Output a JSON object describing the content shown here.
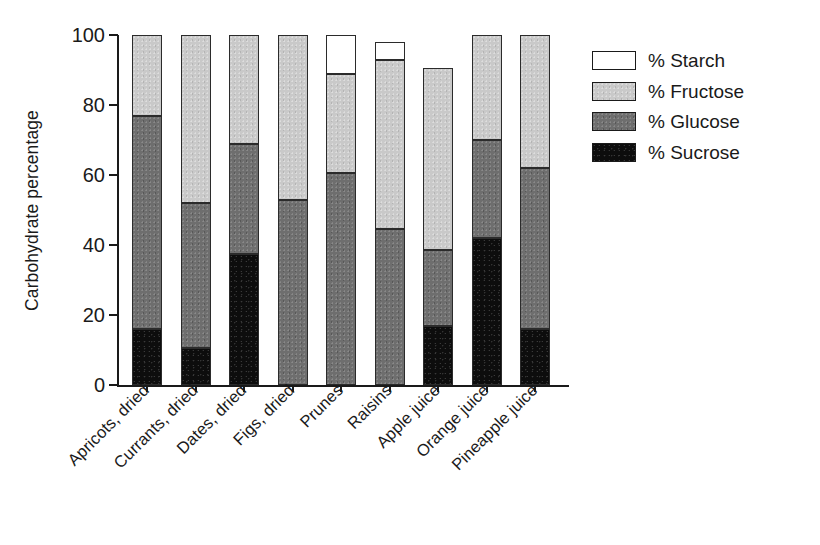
{
  "chart_data": {
    "type": "bar",
    "subtype": "stacked-vertical",
    "title": "",
    "xlabel": "",
    "ylabel": "Carbohydrate percentage",
    "ylim": [
      0,
      100
    ],
    "yticks": [
      0,
      20,
      40,
      60,
      80,
      100
    ],
    "ytick_labels": [
      "0",
      "20",
      "40",
      "60",
      "80",
      "100"
    ],
    "grid": false,
    "legend_position": "right",
    "categories": [
      "Apricots, dried",
      "Currants, dried",
      "Dates, dried",
      "Figs, dried",
      "Prunes",
      "Raisins",
      "Apple juice",
      "Orange juice",
      "Pineapple juice"
    ],
    "series": [
      {
        "name": "% Sucrose",
        "color": "#0d0d0d",
        "values": [
          16,
          10.5,
          37.5,
          0,
          0,
          0,
          17,
          42,
          16
        ]
      },
      {
        "name": "% Glucose",
        "color": "#6e6e6e",
        "values": [
          61,
          41.5,
          31.5,
          53,
          60.5,
          44.5,
          21.5,
          28,
          46
        ]
      },
      {
        "name": "% Fructose",
        "color": "#c9c9c9",
        "values": [
          23,
          48,
          31,
          47,
          28.5,
          48.5,
          52,
          30,
          38
        ]
      },
      {
        "name": "% Starch",
        "color": "#ffffff",
        "values": [
          0,
          0,
          0,
          0,
          11,
          5,
          0,
          0,
          0
        ]
      }
    ],
    "bar_totals": [
      100,
      100,
      100,
      100,
      100,
      98,
      90.5,
      100,
      100
    ]
  },
  "legend": {
    "items": [
      {
        "label": "% Starch",
        "swatch": "starch"
      },
      {
        "label": "% Fructose",
        "swatch": "fructose"
      },
      {
        "label": "% Glucose",
        "swatch": "glucose"
      },
      {
        "label": "% Sucrose",
        "swatch": "sucrose"
      }
    ]
  },
  "colors": {
    "starch": "#ffffff",
    "fructose": "#c9c9c9",
    "glucose": "#6e6e6e",
    "sucrose": "#0d0d0d",
    "axis": "#1a1a1a",
    "background": "#ffffff"
  }
}
